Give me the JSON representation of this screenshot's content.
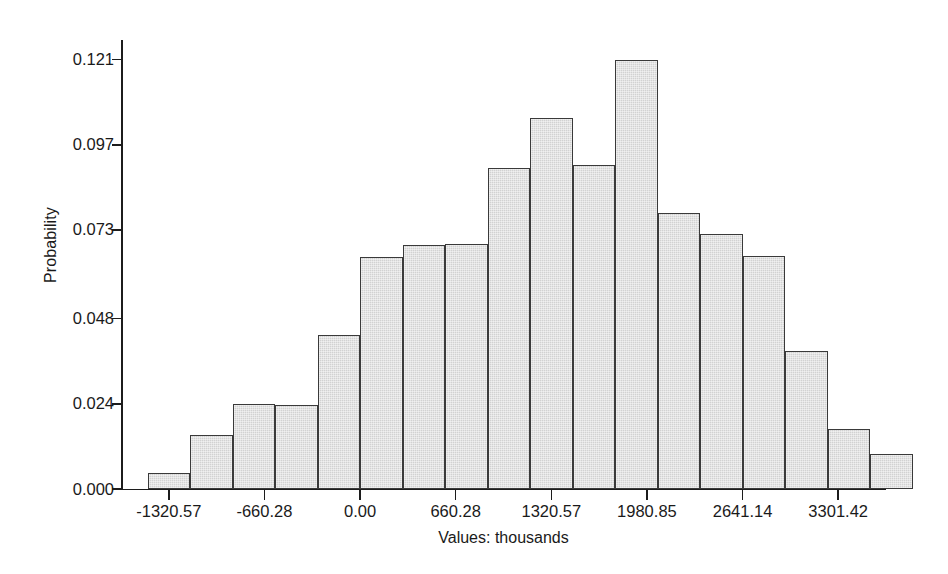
{
  "chart_data": {
    "type": "bar",
    "title": "",
    "subtitle": "",
    "xlabel": "Values: thousands",
    "ylabel": "Probability",
    "grid": false,
    "legend": null,
    "legend_position": "none",
    "bar_fill_color": "#d2d2d2",
    "bar_edge_color": "#3a3a3a",
    "axis_color": "#1c1c1c",
    "background_color": "#ffffff",
    "xlim": [
      -1650.71,
      3631.56
    ],
    "ylim": [
      0.0,
      0.1265
    ],
    "yticks": [
      0.0,
      0.024,
      0.048,
      0.073,
      0.097,
      0.121
    ],
    "ytick_labels": [
      "0.000",
      "0.024",
      "0.048",
      "0.073",
      "0.097",
      "0.121"
    ],
    "xticks": [
      -1320.57,
      -660.28,
      0.0,
      660.28,
      1320.57,
      1980.85,
      2641.14,
      3301.42
    ],
    "xtick_labels": [
      "-1320.57",
      "-660.28",
      "0.00",
      "660.28",
      "1320.57",
      "1980.85",
      "2641.14",
      "3301.42"
    ],
    "bin_width": 293.46,
    "bin_left_edges": [
      -1467.3,
      -1173.85,
      -880.38,
      -586.92,
      -293.46,
      0.0,
      293.46,
      586.92,
      880.38,
      1173.85,
      1467.31,
      1760.77,
      2054.23,
      2347.69,
      2641.15,
      2934.61,
      3228.08,
      3521.54
    ],
    "categories": [
      "-1320.57",
      "-1027.11",
      "-733.65",
      "-440.19",
      "-146.73",
      "146.73",
      "440.19",
      "733.65",
      "1027.11",
      "1320.57",
      "1614.04",
      "1907.50",
      "2200.96",
      "2494.42",
      "2787.88",
      "3081.34",
      "3374.81",
      "3668.27"
    ],
    "values": [
      0.0045,
      0.0152,
      0.0239,
      0.0236,
      0.0434,
      0.0655,
      0.0687,
      0.069,
      0.0905,
      0.1046,
      0.0912,
      0.121,
      0.0777,
      0.0719,
      0.0657,
      0.039,
      0.0169,
      0.01
    ],
    "n_bars": 18
  }
}
